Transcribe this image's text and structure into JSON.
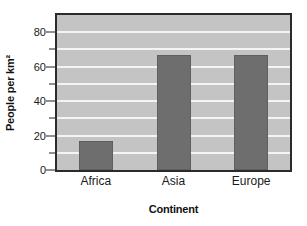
{
  "chart_data": {
    "type": "bar",
    "title": "",
    "xlabel": "Continent",
    "ylabel": "People per km²",
    "categories": [
      "Africa",
      "Asia",
      "Europe"
    ],
    "values": [
      17,
      67,
      67
    ],
    "ylim": [
      0,
      90
    ],
    "ytick_major": [
      0,
      20,
      40,
      60,
      80
    ],
    "ytick_major_labels": [
      "0",
      "20",
      "40",
      "60",
      "80"
    ],
    "ytick_minor": [
      10,
      30,
      50,
      70
    ],
    "gridlines": [
      10,
      20,
      30,
      40,
      50,
      60,
      70,
      80
    ],
    "grid": true,
    "legend": "none",
    "colors": {
      "bar": "#6e6e6e",
      "plot_background": "#c4c4c4",
      "gridline": "#f4f4f4",
      "frame": "#2b2b2b",
      "text": "#1a1a1a",
      "page_background": "#ffffff"
    }
  }
}
